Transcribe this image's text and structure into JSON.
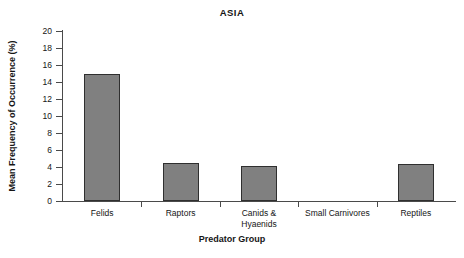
{
  "chart_data": {
    "type": "bar",
    "title": "ASIA",
    "xlabel": "Predator Group",
    "ylabel": "Mean Frequency of Occurrence (%)",
    "categories": [
      "Felids",
      "Raptors",
      "Canids & Hyaenids",
      "Small Carnivores",
      "Reptiles"
    ],
    "category_lines": [
      [
        "Felids"
      ],
      [
        "Raptors"
      ],
      [
        "Canids &",
        "Hyaenids"
      ],
      [
        "Small Carnivores"
      ],
      [
        "Reptiles"
      ]
    ],
    "values": [
      15.0,
      4.5,
      4.1,
      0,
      4.3
    ],
    "ylim": [
      0,
      20
    ],
    "ytick_step": 2,
    "yticks": [
      20,
      18,
      16,
      14,
      12,
      10,
      8,
      6,
      4,
      2,
      0
    ],
    "ytick_labels": [
      "20",
      "18",
      "16",
      "14",
      "12",
      "10",
      "8",
      "6",
      "4",
      "2",
      "0"
    ],
    "grid": false,
    "legend": false,
    "bar_color": "#808080",
    "bar_border_color": "#2f2f2f",
    "axis_color": "#4a4a4a",
    "background": "#ffffff"
  }
}
